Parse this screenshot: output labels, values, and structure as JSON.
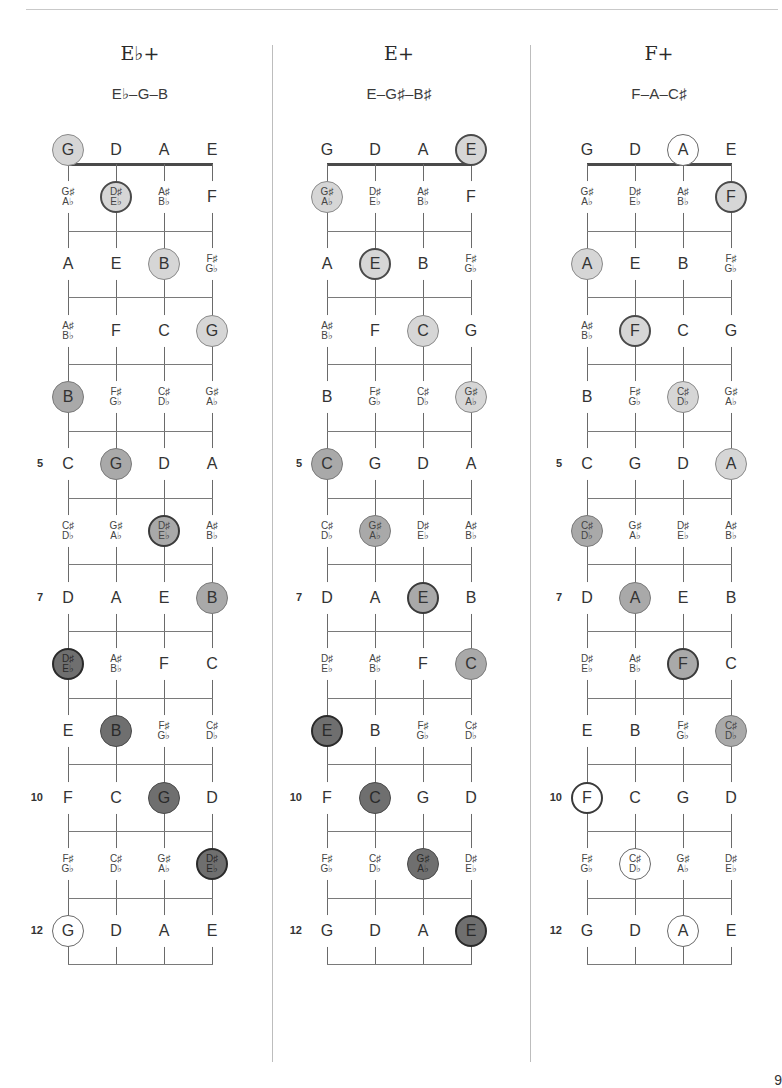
{
  "page": {
    "page_number_partial": "9"
  },
  "layout": {
    "nut_y": 164,
    "fret_spacing": 66.7,
    "open_row_y": 150,
    "num_frets": 12
  },
  "tuning": [
    "G",
    "D",
    "A",
    "E"
  ],
  "fret_numbers_shown": [
    5,
    7,
    10,
    12
  ],
  "fretboard_notes": {
    "G": [
      "G",
      "G♯/A♭",
      "A",
      "A♯/B♭",
      "B",
      "C",
      "C♯/D♭",
      "D",
      "D♯/E♭",
      "E",
      "F",
      "F♯/G♭",
      "G"
    ],
    "D": [
      "D",
      "D♯/E♭",
      "E",
      "F",
      "F♯/G♭",
      "G",
      "G♯/A♭",
      "A",
      "A♯/B♭",
      "B",
      "C",
      "C♯/D♭",
      "D"
    ],
    "A": [
      "A",
      "A♯/B♭",
      "B",
      "C",
      "C♯/D♭",
      "D",
      "D♯/E♭",
      "E",
      "F",
      "F♯/G♭",
      "G",
      "G♯/A♭",
      "A"
    ],
    "E": [
      "E",
      "F",
      "F♯/G♭",
      "G",
      "G♯/A♭",
      "A",
      "A♯/B♭",
      "B",
      "C",
      "C♯/D♭",
      "D",
      "D♯/E♭",
      "E"
    ]
  },
  "charts": [
    {
      "name": "E♭+",
      "notes": "E♭–G–B",
      "left": 0,
      "strings_x": [
        68,
        116,
        164,
        212
      ],
      "highlights": [
        {
          "string": 0,
          "fret": 0,
          "style": "hl-light"
        },
        {
          "string": 1,
          "fret": 1,
          "style": "hl-light-r"
        },
        {
          "string": 2,
          "fret": 2,
          "style": "hl-light"
        },
        {
          "string": 3,
          "fret": 3,
          "style": "hl-light"
        },
        {
          "string": 0,
          "fret": 4,
          "style": "hl-mid"
        },
        {
          "string": 1,
          "fret": 5,
          "style": "hl-mid"
        },
        {
          "string": 2,
          "fret": 6,
          "style": "hl-mid-r"
        },
        {
          "string": 3,
          "fret": 7,
          "style": "hl-mid"
        },
        {
          "string": 0,
          "fret": 8,
          "style": "hl-dark-r"
        },
        {
          "string": 1,
          "fret": 9,
          "style": "hl-dark"
        },
        {
          "string": 2,
          "fret": 10,
          "style": "hl-dark"
        },
        {
          "string": 3,
          "fret": 11,
          "style": "hl-dark-r"
        },
        {
          "string": 0,
          "fret": 12,
          "style": "hl-open"
        }
      ]
    },
    {
      "name": "E+",
      "notes": "E–G♯–B♯",
      "left": 0,
      "strings_x": [
        327,
        375,
        423,
        471
      ],
      "highlights": [
        {
          "string": 3,
          "fret": 0,
          "style": "hl-light-r"
        },
        {
          "string": 0,
          "fret": 1,
          "style": "hl-light"
        },
        {
          "string": 1,
          "fret": 2,
          "style": "hl-light-r"
        },
        {
          "string": 2,
          "fret": 3,
          "style": "hl-light"
        },
        {
          "string": 3,
          "fret": 4,
          "style": "hl-light"
        },
        {
          "string": 0,
          "fret": 5,
          "style": "hl-mid"
        },
        {
          "string": 1,
          "fret": 6,
          "style": "hl-mid"
        },
        {
          "string": 2,
          "fret": 7,
          "style": "hl-mid-r"
        },
        {
          "string": 3,
          "fret": 8,
          "style": "hl-mid"
        },
        {
          "string": 0,
          "fret": 9,
          "style": "hl-dark-r"
        },
        {
          "string": 1,
          "fret": 10,
          "style": "hl-dark"
        },
        {
          "string": 2,
          "fret": 11,
          "style": "hl-dark"
        },
        {
          "string": 3,
          "fret": 12,
          "style": "hl-dark-r"
        }
      ]
    },
    {
      "name": "F+",
      "notes": "F–A–C♯",
      "left": 0,
      "strings_x": [
        587,
        635,
        683,
        731
      ],
      "highlights": [
        {
          "string": 2,
          "fret": 0,
          "style": "hl-open"
        },
        {
          "string": 3,
          "fret": 1,
          "style": "hl-light-r"
        },
        {
          "string": 0,
          "fret": 2,
          "style": "hl-light"
        },
        {
          "string": 1,
          "fret": 3,
          "style": "hl-light-r"
        },
        {
          "string": 2,
          "fret": 4,
          "style": "hl-light"
        },
        {
          "string": 3,
          "fret": 5,
          "style": "hl-light"
        },
        {
          "string": 0,
          "fret": 6,
          "style": "hl-mid"
        },
        {
          "string": 1,
          "fret": 7,
          "style": "hl-mid"
        },
        {
          "string": 2,
          "fret": 8,
          "style": "hl-mid-r"
        },
        {
          "string": 3,
          "fret": 9,
          "style": "hl-mid"
        },
        {
          "string": 0,
          "fret": 10,
          "style": "hl-open-r"
        },
        {
          "string": 1,
          "fret": 11,
          "style": "hl-open"
        },
        {
          "string": 2,
          "fret": 12,
          "style": "hl-open"
        }
      ]
    }
  ],
  "colors": {
    "light": "#d6d6d6",
    "mid": "#a9a9a9",
    "dark": "#6f6f6f",
    "line": "#7a7a7a",
    "nut": "#4a4a4a"
  }
}
